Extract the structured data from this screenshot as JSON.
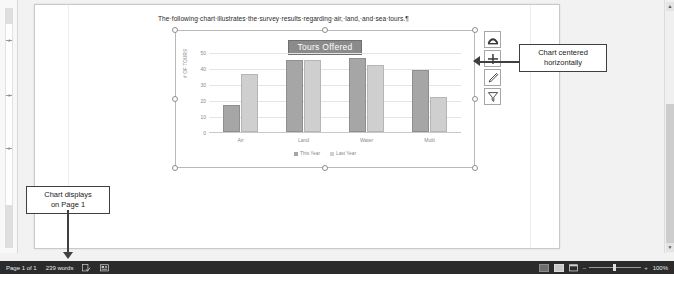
{
  "document": {
    "paragraph": "The·following·chart·illustrates·the·survey·results·regarding·air,·land,·and·sea·tours.¶"
  },
  "ruler": {
    "numbers": [
      "4",
      "3",
      "2"
    ]
  },
  "chart_data": {
    "type": "bar",
    "title": "Tours Offered",
    "categories": [
      "Air",
      "Land",
      "Water",
      "Multi"
    ],
    "series": [
      {
        "name": "This Year",
        "values": [
          17,
          45,
          46,
          39
        ],
        "color": "#a6a6a6"
      },
      {
        "name": "Last Year",
        "values": [
          36,
          45,
          42,
          22
        ],
        "color": "#cfcfcf"
      }
    ],
    "xlabel": "",
    "ylabel": "# OF TOURS",
    "ylim": [
      0,
      50
    ],
    "yticks": [
      0,
      10,
      20,
      30,
      40,
      50
    ],
    "grid": true,
    "legend_position": "bottom"
  },
  "chart_buttons": [
    {
      "name": "layout-options-button",
      "icon": "layout-options-icon"
    },
    {
      "name": "chart-elements-button",
      "icon": "plus-icon"
    },
    {
      "name": "chart-styles-button",
      "icon": "brush-icon"
    },
    {
      "name": "chart-filters-button",
      "icon": "funnel-icon"
    }
  ],
  "callouts": {
    "right": "Chart centered\nhorizontally",
    "left": "Chart displays\non Page 1"
  },
  "status_bar": {
    "page": "Page 1 of 1",
    "words": "239 words",
    "proofing_icon": "proofing-icon",
    "accessibility_icon": "accessibility-icon",
    "zoom_out": "–",
    "zoom_in": "+",
    "zoom_level": "100%",
    "view_read_icon": "read-mode-icon",
    "view_print_icon": "print-layout-icon",
    "view_web_icon": "web-layout-icon"
  }
}
